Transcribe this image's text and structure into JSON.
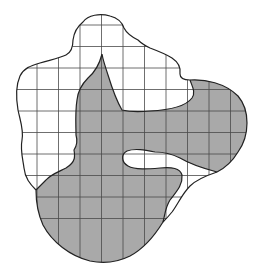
{
  "figure": {
    "colors": {
      "background": "#ffffff",
      "shaded_region": "#a9a9a9",
      "outline": "#222222",
      "grid": "#4a4a4a"
    },
    "grid": {
      "columns": 10,
      "rows": 11
    },
    "regions": [
      {
        "name": "outer-region",
        "fill": "unshaded"
      },
      {
        "name": "shaded-region",
        "fill": "shaded"
      }
    ]
  }
}
